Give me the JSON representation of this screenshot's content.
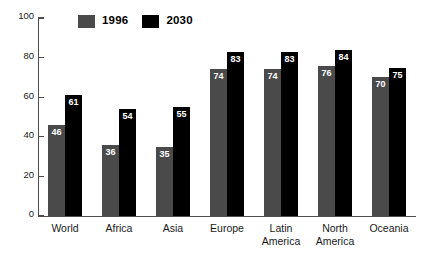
{
  "chart_data": {
    "type": "bar",
    "title": "",
    "xlabel": "",
    "ylabel": "",
    "ylim": [
      0,
      100
    ],
    "yticks": [
      "0",
      "20",
      "40",
      "60",
      "80",
      "100"
    ],
    "grid": false,
    "legend_position": "top-left",
    "categories": [
      "World",
      "Africa",
      "Asia",
      "Europe",
      "Latin America",
      "North America",
      "Oceania"
    ],
    "category_lines": [
      [
        "World"
      ],
      [
        "Africa"
      ],
      [
        "Asia"
      ],
      [
        "Europe"
      ],
      [
        "Latin",
        "America"
      ],
      [
        "North",
        "America"
      ],
      [
        "Oceania"
      ]
    ],
    "series": [
      {
        "name": "1996",
        "color": "#4a4a4a",
        "values": [
          46,
          36,
          35,
          74,
          74,
          76,
          70
        ]
      },
      {
        "name": "2030",
        "color": "#000000",
        "values": [
          61,
          54,
          55,
          83,
          83,
          84,
          75
        ]
      }
    ]
  },
  "legend": {
    "entries": [
      {
        "label": "1996",
        "swatch": "legend-swatch-1996"
      },
      {
        "label": "2030",
        "swatch": "legend-swatch-2030"
      }
    ]
  },
  "colors": {
    "series_1996": "#4a4a4a",
    "series_2030": "#000000",
    "axis": "#4d4d4d",
    "background": "#ffffff",
    "value_label_text": "#ffffff"
  }
}
